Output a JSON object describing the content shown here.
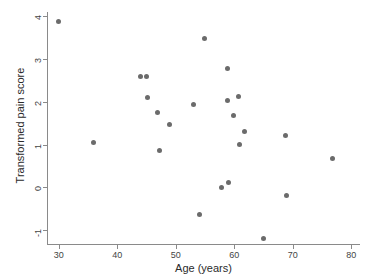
{
  "chart_data": {
    "type": "scatter",
    "title": "",
    "xlabel": "Age (years)",
    "ylabel": "Transformed pain score",
    "xlim": [
      28.0,
      81.5
    ],
    "ylim": [
      -1.35,
      4.1
    ],
    "xticks": [
      30,
      40,
      50,
      60,
      70,
      80
    ],
    "yticks": [
      -1,
      0,
      1,
      2,
      3,
      4
    ],
    "xtick_labels": [
      "30",
      "40",
      "50",
      "60",
      "70",
      "80"
    ],
    "ytick_labels": [
      "-1",
      "0",
      "1",
      "2",
      "3",
      "4"
    ],
    "grid": false,
    "legend": null,
    "marker": {
      "shape": "circle",
      "color": "#6b6b6b",
      "size": 5
    },
    "series": [
      {
        "name": "patients",
        "points": [
          {
            "x": 29.9,
            "y": 3.88
          },
          {
            "x": 36.0,
            "y": 1.05
          },
          {
            "x": 43.9,
            "y": 2.6
          },
          {
            "x": 45.0,
            "y": 2.6
          },
          {
            "x": 45.1,
            "y": 2.1
          },
          {
            "x": 46.9,
            "y": 1.76
          },
          {
            "x": 47.2,
            "y": 0.87
          },
          {
            "x": 48.9,
            "y": 1.48
          },
          {
            "x": 53.0,
            "y": 1.93
          },
          {
            "x": 54.0,
            "y": -0.63
          },
          {
            "x": 55.0,
            "y": 3.49
          },
          {
            "x": 57.9,
            "y": 0.0
          },
          {
            "x": 58.8,
            "y": 2.79
          },
          {
            "x": 58.9,
            "y": 2.03
          },
          {
            "x": 59.0,
            "y": 0.11
          },
          {
            "x": 59.9,
            "y": 1.69
          },
          {
            "x": 60.8,
            "y": 2.12
          },
          {
            "x": 60.9,
            "y": 0.99
          },
          {
            "x": 61.8,
            "y": 1.3
          },
          {
            "x": 65.0,
            "y": -1.2
          },
          {
            "x": 68.8,
            "y": 1.2
          },
          {
            "x": 69.0,
            "y": -0.2
          },
          {
            "x": 76.8,
            "y": 0.67
          }
        ]
      }
    ]
  },
  "axes": {
    "x_title": "Age (years)",
    "y_title": "Transformed pain score"
  }
}
